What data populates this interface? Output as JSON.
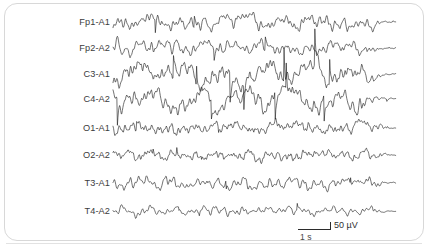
{
  "figure": {
    "name": "eeg-recording",
    "background_color": "#ffffff",
    "trace_color": "#1c1c1c",
    "label_color": "#3c3c3c",
    "border_color": "#d8d8d8",
    "width": 434,
    "height": 251
  },
  "calibration": {
    "amplitude_label": "50 µV",
    "time_label": "1 s",
    "amplitude_value": 50,
    "amplitude_unit": "µV",
    "time_value": 1,
    "time_unit": "s"
  },
  "chart_data": {
    "type": "line",
    "title": "",
    "xlabel": "",
    "ylabel": "",
    "grid": false,
    "legend": "none",
    "montage": "referential (ear reference)",
    "trace_x_start": 113,
    "trace_x_end": 396,
    "series": [
      {
        "name": "Fp1-A1",
        "label": "Fp1-A1",
        "baseline_y": 22,
        "amplitude": 7.5,
        "seed": 11,
        "freq": 1.25,
        "spike_rate": 0.16,
        "spike_gain": 1.35,
        "slow_amp": 2.2,
        "slow_freq": 0.22,
        "taper_from": 0.9
      },
      {
        "name": "Fp2-A2",
        "label": "Fp2-A2",
        "baseline_y": 48,
        "amplitude": 7.0,
        "seed": 23,
        "freq": 1.2,
        "spike_rate": 0.15,
        "spike_gain": 1.3,
        "slow_amp": 2.0,
        "slow_freq": 0.2,
        "taper_from": 0.9
      },
      {
        "name": "C3-A1",
        "label": "C3-A1",
        "baseline_y": 74,
        "amplitude": 9.0,
        "seed": 37,
        "freq": 1.35,
        "spike_rate": 0.3,
        "spike_gain": 2.6,
        "slow_amp": 8.5,
        "slow_freq": 0.135,
        "taper_from": 0.88
      },
      {
        "name": "C4-A2",
        "label": "C4-A2",
        "baseline_y": 99,
        "amplitude": 8.5,
        "seed": 53,
        "freq": 1.3,
        "spike_rate": 0.28,
        "spike_gain": 2.4,
        "slow_amp": 8.0,
        "slow_freq": 0.125,
        "taper_from": 0.88
      },
      {
        "name": "O1-A1",
        "label": "O1-A1",
        "baseline_y": 128,
        "amplitude": 5.5,
        "seed": 71,
        "freq": 1.55,
        "spike_rate": 0.1,
        "spike_gain": 1.0,
        "slow_amp": 1.4,
        "slow_freq": 0.28,
        "taper_from": 0.93
      },
      {
        "name": "O2-A2",
        "label": "O2-A2",
        "baseline_y": 155,
        "amplitude": 5.0,
        "seed": 89,
        "freq": 1.6,
        "spike_rate": 0.09,
        "spike_gain": 0.95,
        "slow_amp": 1.2,
        "slow_freq": 0.3,
        "taper_from": 0.93
      },
      {
        "name": "T3-A1",
        "label": "T3-A1",
        "baseline_y": 183,
        "amplitude": 6.0,
        "seed": 103,
        "freq": 1.15,
        "spike_rate": 0.12,
        "spike_gain": 1.15,
        "slow_amp": 1.8,
        "slow_freq": 0.24,
        "taper_from": 0.92
      },
      {
        "name": "T4-A2",
        "label": "T4-A2",
        "baseline_y": 211,
        "amplitude": 4.6,
        "seed": 127,
        "freq": 1.1,
        "spike_rate": 0.1,
        "spike_gain": 1.0,
        "slow_amp": 1.3,
        "slow_freq": 0.26,
        "taper_from": 0.92
      }
    ]
  }
}
